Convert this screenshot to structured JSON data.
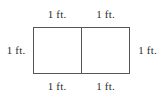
{
  "figure": {
    "type": "geometry-diagram",
    "canvas": {
      "width": 164,
      "height": 102,
      "background": "#ffffff"
    },
    "shape": {
      "name": "rectangle",
      "subdivisions": 2,
      "divider_orientation": "vertical",
      "stroke_color": "#555555",
      "fill_color": "#ffffff"
    },
    "labels": {
      "top_left": "1 ft.",
      "top_right": "1 ft.",
      "left": "1 ft.",
      "right": "1 ft.",
      "bottom_left": "1 ft.",
      "bottom_right": "1 ft."
    },
    "text_color": "#2b2b2b"
  }
}
